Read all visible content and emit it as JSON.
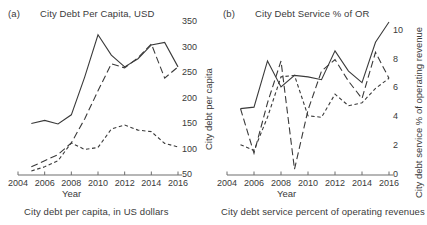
{
  "figure": {
    "width": 427,
    "height": 225,
    "background": "#ffffff",
    "ink_color": "#3a3a3a",
    "axis_color": "#6e6e6e"
  },
  "panels": [
    {
      "tag": "(a)",
      "title": "City Debt Per Capita, USD",
      "caption": "City debt per capita, in US dollars",
      "xlabel": "Year",
      "ylabel": "City debt per capita"
    },
    {
      "tag": "(b)",
      "title": "City Debt Service % of OR",
      "caption": "City debt service percent of operating revenues",
      "xlabel": "Year",
      "ylabel": "City debt service % of operating revenue"
    }
  ],
  "chart_data": [
    {
      "type": "line",
      "panel": "(a)",
      "title": "City Debt Per Capita, USD",
      "xlabel": "Year",
      "ylabel": "City debt per capita",
      "x": [
        2004,
        2005,
        2006,
        2007,
        2008,
        2009,
        2010,
        2011,
        2012,
        2013,
        2014,
        2015,
        2016
      ],
      "xlim": [
        2004,
        2016
      ],
      "ylim": [
        50,
        350
      ],
      "xticks": [
        2004,
        2006,
        2008,
        2010,
        2012,
        2014,
        2016
      ],
      "yticks": [
        50,
        100,
        150,
        200,
        250,
        300,
        350
      ],
      "xtick_labels": [
        "2004",
        "2006",
        "2008",
        "2010",
        "2012",
        "2014",
        "2016"
      ],
      "ytick_labels": [
        "50",
        "100",
        "150",
        "200",
        "250",
        "300",
        "350"
      ],
      "grid": false,
      "legend": "none",
      "yaxis_side": "right",
      "series": [
        {
          "name": "series-solid",
          "style": "solid",
          "x": [
            2005,
            2006,
            2007,
            2008,
            2009,
            2010,
            2011,
            2012,
            2013,
            2014,
            2015,
            2016
          ],
          "values": [
            151,
            157,
            150,
            168,
            242,
            325,
            285,
            262,
            278,
            305,
            310,
            262
          ]
        },
        {
          "name": "series-long-dash",
          "style": "long-dash",
          "x": [
            2005,
            2006,
            2007,
            2008,
            2009,
            2010,
            2011,
            2012,
            2013,
            2014,
            2015,
            2016
          ],
          "values": [
            66,
            78,
            90,
            113,
            160,
            215,
            268,
            260,
            280,
            307,
            240,
            262
          ]
        },
        {
          "name": "series-short-dash",
          "style": "short-dash",
          "x": [
            2005,
            2006,
            2007,
            2008,
            2009,
            2010,
            2011,
            2012,
            2013,
            2014,
            2015,
            2016
          ],
          "values": [
            58,
            66,
            78,
            113,
            100,
            104,
            140,
            148,
            138,
            135,
            112,
            105
          ]
        }
      ]
    },
    {
      "type": "line",
      "panel": "(b)",
      "title": "City Debt Service % of OR",
      "xlabel": "Year",
      "ylabel": "City debt service % of operating revenue",
      "x": [
        2004,
        2005,
        2006,
        2007,
        2008,
        2009,
        2010,
        2011,
        2012,
        2013,
        2014,
        2015,
        2016
      ],
      "xlim": [
        2004,
        2016
      ],
      "ylim": [
        0,
        10.6
      ],
      "xticks": [
        2004,
        2006,
        2008,
        2010,
        2012,
        2014,
        2016
      ],
      "yticks": [
        0,
        2,
        4,
        6,
        8,
        10
      ],
      "xtick_labels": [
        "2004",
        "2006",
        "2008",
        "2010",
        "2012",
        "2014",
        "2016"
      ],
      "ytick_labels": [
        "0",
        "2",
        "4",
        "6",
        "8",
        "10"
      ],
      "grid": false,
      "legend": "none",
      "yaxis_side": "right",
      "series": [
        {
          "name": "series-solid",
          "style": "solid",
          "x": [
            2005,
            2006,
            2007,
            2008,
            2009,
            2010,
            2011,
            2012,
            2013,
            2014,
            2015,
            2016
          ],
          "values": [
            4.6,
            4.7,
            7.9,
            6.1,
            6.9,
            6.8,
            6.6,
            8.6,
            7.2,
            6.4,
            9.2,
            10.6
          ]
        },
        {
          "name": "series-long-dash",
          "style": "long-dash",
          "x": [
            2005,
            2006,
            2007,
            2008,
            2009,
            2010,
            2011,
            2012,
            2013,
            2014,
            2015,
            2016
          ],
          "values": [
            4.6,
            1.5,
            5.0,
            7.9,
            0.4,
            4.5,
            7.2,
            8.0,
            6.5,
            5.3,
            8.5,
            6.7
          ]
        },
        {
          "name": "series-short-dash",
          "style": "short-dash",
          "x": [
            2005,
            2006,
            2007,
            2008,
            2009,
            2010,
            2011,
            2012,
            2013,
            2014,
            2015,
            2016
          ],
          "values": [
            2.1,
            1.7,
            4.0,
            6.8,
            6.9,
            4.1,
            4.0,
            5.6,
            4.8,
            5.0,
            6.0,
            6.7
          ]
        }
      ]
    }
  ]
}
